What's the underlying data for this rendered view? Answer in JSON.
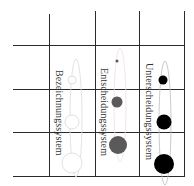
{
  "diagram": {
    "columns": [
      {
        "label": "Bezeichnungssystem",
        "dot_color": "#ffffff",
        "stroke": "#d8d8d8",
        "ellipse_stroke": "#dcdcdc"
      },
      {
        "label": "Entscheidungssystem",
        "dot_color": "#5a5a5a",
        "stroke": "#5a5a5a",
        "ellipse_stroke": "#f0e0e0"
      },
      {
        "label": "Unterscheidungssystem",
        "dot_color": "#000000",
        "stroke": "#000000",
        "ellipse_stroke": "#bdbdbd"
      }
    ],
    "grid": {
      "vertical_x": [
        49,
        95,
        139,
        184
      ],
      "horizontal_y": [
        45,
        89,
        132,
        176
      ]
    }
  }
}
